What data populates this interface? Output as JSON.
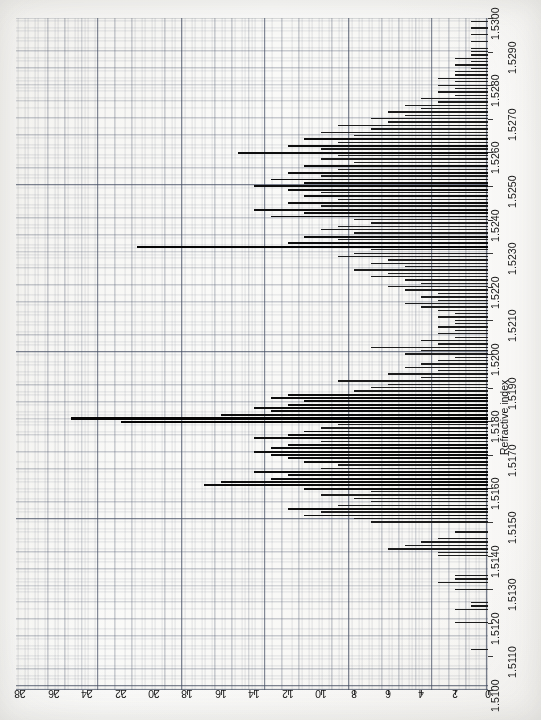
{
  "figure": {
    "orientation": "rotated-90-ccw",
    "background_color": "#fdfdfc",
    "grid_color": "#4e586e",
    "bar_color": "#1c1c1c"
  },
  "axis_titles": {
    "refractive_index": "Refractive index",
    "number_of_specimens": "Number of specimens"
  },
  "x_ticks": [
    "1.5100",
    "1.5110",
    "1.5120",
    "1.5130",
    "1.5140",
    "1.5150",
    "1.5160",
    "1.5170",
    "1.5180",
    "1.5190",
    "1.5200",
    "1.5210",
    "1.5220",
    "1.5230",
    "1.5240",
    "1.5250",
    "1.5260",
    "1.5270",
    "1.5280",
    "1.5290",
    "1.5300"
  ],
  "y_ticks": [
    "0",
    "2",
    "4",
    "6",
    "8",
    "10",
    "12",
    "14",
    "16",
    "18",
    "20",
    "22",
    "24",
    "26",
    "28"
  ],
  "chart_data": {
    "type": "bar",
    "title": "",
    "subtitle": "",
    "xlabel": "Refractive index",
    "ylabel": "Number of specimens",
    "orientation": "horizontal-bars-on-rotated-page",
    "grid": true,
    "legend": null,
    "xlim": [
      1.51,
      1.53
    ],
    "ylim": [
      0,
      29
    ],
    "xtick_step": 0.001,
    "ytick_step": 2,
    "bin_width": 0.0001,
    "x": [
      1.51,
      1.5101,
      1.5102,
      1.5103,
      1.5104,
      1.5105,
      1.5106,
      1.5107,
      1.5108,
      1.5109,
      1.511,
      1.5111,
      1.5112,
      1.5113,
      1.5114,
      1.5115,
      1.5116,
      1.5117,
      1.5118,
      1.5119,
      1.512,
      1.5121,
      1.5122,
      1.5123,
      1.5124,
      1.5125,
      1.5126,
      1.5127,
      1.5128,
      1.5129,
      1.513,
      1.5131,
      1.5132,
      1.5133,
      1.5134,
      1.5135,
      1.5136,
      1.5137,
      1.5138,
      1.5139,
      1.514,
      1.5141,
      1.5142,
      1.5143,
      1.5144,
      1.5145,
      1.5146,
      1.5147,
      1.5148,
      1.5149,
      1.515,
      1.5151,
      1.5152,
      1.5153,
      1.5154,
      1.5155,
      1.5156,
      1.5157,
      1.5158,
      1.5159,
      1.516,
      1.5161,
      1.5162,
      1.5163,
      1.5164,
      1.5165,
      1.5166,
      1.5167,
      1.5168,
      1.5169,
      1.517,
      1.5171,
      1.5172,
      1.5173,
      1.5174,
      1.5175,
      1.5176,
      1.5177,
      1.5178,
      1.5179,
      1.518,
      1.5181,
      1.5182,
      1.5183,
      1.5184,
      1.5185,
      1.5186,
      1.5187,
      1.5188,
      1.5189,
      1.519,
      1.5191,
      1.5192,
      1.5193,
      1.5194,
      1.5195,
      1.5196,
      1.5197,
      1.5198,
      1.5199,
      1.52,
      1.5201,
      1.5202,
      1.5203,
      1.5204,
      1.5205,
      1.5206,
      1.5207,
      1.5208,
      1.5209,
      1.521,
      1.5211,
      1.5212,
      1.5213,
      1.5214,
      1.5215,
      1.5216,
      1.5217,
      1.5218,
      1.5219,
      1.522,
      1.5221,
      1.5222,
      1.5223,
      1.5224,
      1.5225,
      1.5226,
      1.5227,
      1.5228,
      1.5229,
      1.523,
      1.5231,
      1.5232,
      1.5233,
      1.5234,
      1.5235,
      1.5236,
      1.5237,
      1.5238,
      1.5239,
      1.524,
      1.5241,
      1.5242,
      1.5243,
      1.5244,
      1.5245,
      1.5246,
      1.5247,
      1.5248,
      1.5249,
      1.525,
      1.5251,
      1.5252,
      1.5253,
      1.5254,
      1.5255,
      1.5256,
      1.5257,
      1.5258,
      1.5259,
      1.526,
      1.5261,
      1.5262,
      1.5263,
      1.5264,
      1.5265,
      1.5266,
      1.5267,
      1.5268,
      1.5269,
      1.527,
      1.5271,
      1.5272,
      1.5273,
      1.5274,
      1.5275,
      1.5276,
      1.5277,
      1.5278,
      1.5279,
      1.528,
      1.5281,
      1.5282,
      1.5283,
      1.5284,
      1.5285,
      1.5286,
      1.5287,
      1.5288,
      1.5289,
      1.529,
      1.5291,
      1.5292,
      1.5293,
      1.5294,
      1.5295,
      1.5296,
      1.5297,
      1.5298,
      1.5299
    ],
    "values": [
      0,
      0,
      0,
      0,
      0,
      0,
      0,
      0,
      0,
      0,
      0,
      0,
      1,
      0,
      0,
      0,
      0,
      0,
      0,
      0,
      2,
      0,
      0,
      0,
      2,
      1,
      1,
      0,
      0,
      0,
      2,
      0,
      3,
      2,
      2,
      0,
      0,
      0,
      0,
      0,
      3,
      3,
      6,
      5,
      4,
      3,
      0,
      2,
      0,
      0,
      7,
      8,
      11,
      10,
      12,
      9,
      7,
      8,
      10,
      7,
      11,
      17,
      16,
      13,
      12,
      14,
      10,
      9,
      11,
      12,
      13,
      14,
      13,
      12,
      10,
      14,
      12,
      11,
      10,
      9,
      22,
      25,
      16,
      13,
      14,
      12,
      11,
      13,
      12,
      8,
      7,
      6,
      9,
      4,
      6,
      3,
      5,
      4,
      3,
      2,
      5,
      4,
      7,
      3,
      4,
      2,
      3,
      2,
      3,
      2,
      2,
      3,
      2,
      3,
      4,
      5,
      3,
      4,
      3,
      5,
      6,
      4,
      5,
      7,
      6,
      8,
      5,
      7,
      6,
      9,
      8,
      7,
      21,
      12,
      9,
      11,
      8,
      10,
      9,
      7,
      8,
      13,
      11,
      14,
      10,
      12,
      9,
      11,
      10,
      12,
      14,
      11,
      13,
      10,
      12,
      9,
      11,
      8,
      10,
      9,
      15,
      10,
      12,
      9,
      11,
      8,
      10,
      7,
      9,
      6,
      7,
      5,
      6,
      4,
      5,
      3,
      4,
      2,
      3,
      2,
      3,
      2,
      3,
      2,
      2,
      1,
      2,
      1,
      2,
      1,
      1,
      1,
      0,
      1,
      0,
      1,
      0,
      1,
      0,
      1
    ],
    "notes": {
      "peak_values": [
        {
          "x": 1.5181,
          "y": 25,
          "description": "tallest bar, ~25-26 specimens"
        },
        {
          "x": 1.518,
          "y": 22,
          "description": "second tallest, ~22 specimens"
        },
        {
          "x": 1.5232,
          "y": 21,
          "description": "isolated tall bar near 1.5232"
        },
        {
          "x": 1.5161,
          "y": 17,
          "description": "local peak around 1.5161"
        }
      ],
      "distribution": "strongly right-skewed mode near 1.5180 with a broad secondary shoulder 1.5240-1.5265",
      "range_with_data": [
        1.5112,
        1.5299
      ]
    }
  }
}
